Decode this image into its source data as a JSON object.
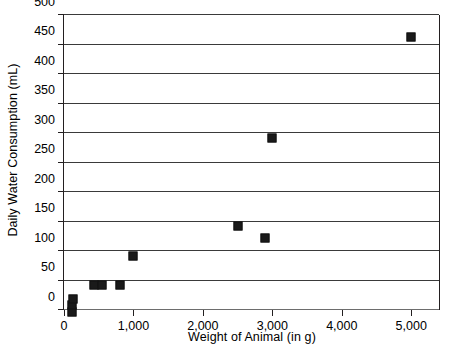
{
  "chart_data": {
    "type": "scatter",
    "title": "",
    "xlabel": "Weight of Animal (in g)",
    "ylabel": "Daily Water Consumption (mL)",
    "xlim": [
      0,
      5400
    ],
    "ylim": [
      0,
      500
    ],
    "x_ticks": [
      0,
      1000,
      2000,
      3000,
      4000,
      5000
    ],
    "x_tick_labels": [
      "0",
      "1,000",
      "2,000",
      "3,000",
      "4,000",
      "5,000"
    ],
    "y_ticks": [
      0,
      50,
      100,
      150,
      200,
      250,
      300,
      350,
      400,
      450,
      500
    ],
    "y_tick_labels": [
      "0",
      "50",
      "100",
      "150",
      "200",
      "250",
      "300",
      "350",
      "400",
      "450",
      "500"
    ],
    "grid": "horizontal",
    "legend": "none",
    "marker": "filled-square",
    "marker_color": "#1a1a1a",
    "points": [
      {
        "x": 110,
        "y": 5
      },
      {
        "x": 120,
        "y": 16
      },
      {
        "x": 130,
        "y": 26
      },
      {
        "x": 430,
        "y": 50
      },
      {
        "x": 540,
        "y": 50
      },
      {
        "x": 800,
        "y": 50
      },
      {
        "x": 1000,
        "y": 100
      },
      {
        "x": 2500,
        "y": 150
      },
      {
        "x": 2900,
        "y": 130
      },
      {
        "x": 3000,
        "y": 300
      },
      {
        "x": 5000,
        "y": 470
      }
    ]
  }
}
